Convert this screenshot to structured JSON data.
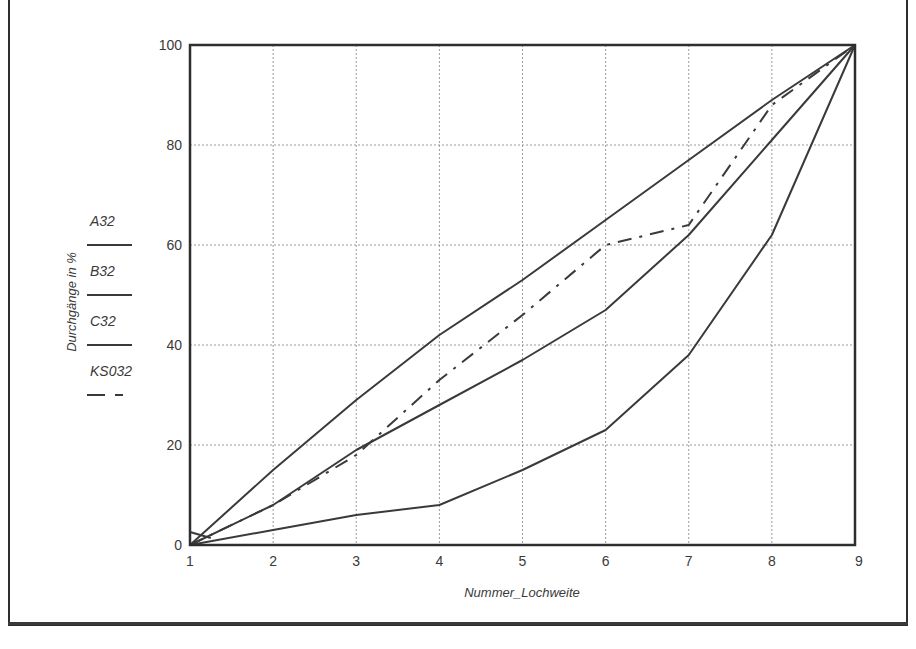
{
  "chart_data": {
    "type": "line",
    "title": "",
    "xlabel": "Nummer_Lochweite",
    "ylabel": "Durchgänge in %",
    "x": [
      1,
      2,
      3,
      4,
      5,
      6,
      7,
      8,
      9
    ],
    "xticks": [
      "1",
      "2",
      "3",
      "4",
      "5",
      "6",
      "7",
      "8",
      "9"
    ],
    "yticks": [
      "0",
      "20",
      "40",
      "60",
      "80",
      "100"
    ],
    "xlim": [
      1,
      9
    ],
    "ylim": [
      0,
      100
    ],
    "grid": true,
    "legend_position": "left (beside y-axis label)",
    "series": [
      {
        "name": "A32",
        "style": "solid",
        "values": [
          0,
          15,
          29,
          42,
          53,
          65,
          77,
          89,
          100
        ]
      },
      {
        "name": "B32",
        "style": "solid",
        "values": [
          0,
          8,
          19,
          28,
          37,
          47,
          62,
          81,
          100
        ]
      },
      {
        "name": "C32",
        "style": "solid",
        "values": [
          0,
          3,
          6,
          8,
          15,
          23,
          38,
          62,
          100
        ]
      },
      {
        "name": "KS032",
        "style": "dash-dot",
        "values": [
          0,
          8,
          18,
          33,
          46,
          60,
          64,
          88,
          100
        ]
      }
    ]
  },
  "legend": {
    "items": [
      {
        "label": "A32",
        "style": "solid"
      },
      {
        "label": "B32",
        "style": "solid"
      },
      {
        "label": "C32",
        "style": "solid"
      },
      {
        "label": "KS032",
        "style": "dash-dot"
      }
    ]
  },
  "colors": {
    "line": "#3a3a3a",
    "grid": "#9a9a9a",
    "frame": "#2e2e2e"
  }
}
